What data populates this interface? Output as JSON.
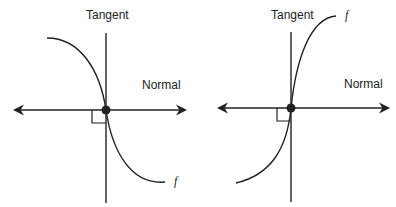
{
  "figures": [
    {
      "id": "left",
      "labels": {
        "tangent": "Tangent",
        "normal": "Normal",
        "function": "f"
      },
      "description": "Decreasing curve f with vertical tangent at inflection point; normal is horizontal"
    },
    {
      "id": "right",
      "labels": {
        "tangent": "Tangent",
        "normal": "Normal",
        "function": "f"
      },
      "description": "Increasing curve f with vertical tangent at inflection point; normal is horizontal"
    }
  ],
  "colors": {
    "stroke": "#222222",
    "background": "#ffffff"
  }
}
